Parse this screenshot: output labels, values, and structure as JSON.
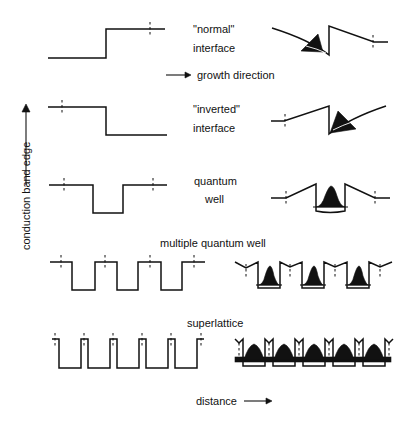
{
  "diagram": {
    "axis": {
      "y_label": "conduction band edge",
      "x_label": "distance",
      "growth_label": "growth direction"
    },
    "rows": [
      {
        "id": "normal",
        "label_line1": "\"normal\"",
        "label_line2": "interface"
      },
      {
        "id": "inverted",
        "label_line1": "\"inverted\"",
        "label_line2": "interface"
      },
      {
        "id": "quantum-well",
        "label_line1": "quantum",
        "label_line2": "well"
      },
      {
        "id": "mqw",
        "label_line1": "multiple quantum well"
      },
      {
        "id": "superlattice",
        "label_line1": "superlattice"
      }
    ],
    "colors": {
      "ink": "#111111",
      "background": "#ffffff"
    }
  }
}
